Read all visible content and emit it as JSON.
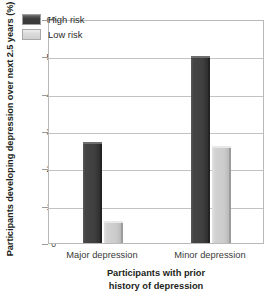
{
  "chart_data": {
    "type": "bar",
    "title": "",
    "categories": [
      "Major depression",
      "Minor depression"
    ],
    "series": [
      {
        "name": "High risk",
        "values": [
          27,
          50
        ],
        "color": "#3f3f3f"
      },
      {
        "name": "Low risk",
        "values": [
          6,
          26
        ],
        "color": "#cbcbcb"
      }
    ],
    "xlabel": "Participants with prior history of depression",
    "xlabel_lines": [
      "Participants with prior",
      "history of depression"
    ],
    "ylabel": "Participants developing depression over next 2.5 years (%)",
    "ylim": [
      0,
      60
    ],
    "yticks": [
      0,
      10,
      20,
      30,
      40,
      50,
      60
    ],
    "ytick_labels": [
      "0",
      "10",
      "20",
      "30",
      "40",
      "50",
      "60"
    ],
    "grid": true,
    "grid_axis": "y",
    "legend_position": "top-left",
    "legend_entries": [
      "High risk",
      "Low risk"
    ]
  },
  "legend": {
    "items": [
      {
        "label": "High risk",
        "swatch": "high-risk-swatch"
      },
      {
        "label": "Low risk",
        "swatch": "low-risk-swatch"
      }
    ]
  },
  "axes": {
    "y_title": "Participants developing depression over next 2.5 years (%)",
    "x_title_line1": "Participants with prior",
    "x_title_line2": "history of depression",
    "y_ticks": [
      "60",
      "50",
      "40",
      "30",
      "20",
      "10",
      "0"
    ],
    "x_categories": [
      "Major depression",
      "Minor depression"
    ]
  },
  "colors": {
    "high_risk": "#3f3f3f",
    "low_risk": "#cbcbcb",
    "grid": "#c3c3c3",
    "frame": "#b9b9b9",
    "text": "#231f20",
    "background": "#ffffff"
  }
}
